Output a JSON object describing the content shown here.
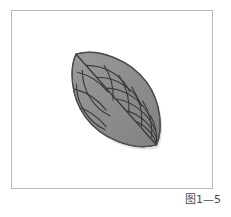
{
  "figure": {
    "caption": "图1—5",
    "frame": {
      "border_color": "#b9b9b9",
      "background": "#ffffff"
    },
    "illustration": {
      "name": "leaf-with-net-veins",
      "description": "Shaded leaf-shaped (lens) outline with a diagonal midrib and curved lateral veins forming a net pattern",
      "fill_color": "#8e8e8e",
      "outline_color": "#4d4d4d",
      "vein_color": "#3a3a3a",
      "shadow_color": "#6f6f6f",
      "tip_top_left": "75,53",
      "tip_bottom_right": "157,145",
      "midrib_label": "midrib",
      "left_vein_count": 6,
      "right_vein_count": 6
    }
  }
}
